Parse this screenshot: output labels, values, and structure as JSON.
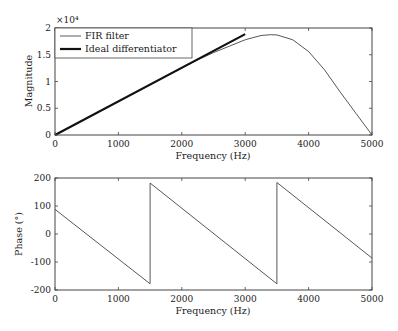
{
  "chart_data": [
    {
      "type": "line",
      "title": "",
      "xlabel": "Frequency (Hz)",
      "ylabel": "Magnitude",
      "y_multiplier_label": "×10⁴",
      "xlim": [
        0,
        5000
      ],
      "ylim": [
        0,
        2
      ],
      "xticks": [
        0,
        1000,
        2000,
        3000,
        4000,
        5000
      ],
      "xtick_labels": [
        "0",
        "1000",
        "2000",
        "3000",
        "4000",
        "5000"
      ],
      "yticks": [
        0,
        0.5,
        1,
        1.5,
        2
      ],
      "ytick_labels": [
        "0",
        "0.5",
        "1",
        "1.5",
        "2"
      ],
      "grid": false,
      "legend_position": "top-left",
      "series": [
        {
          "name": "FIR filter",
          "style": "thin",
          "x": [
            0,
            250,
            500,
            750,
            1000,
            1250,
            1500,
            1750,
            2000,
            2250,
            2500,
            2750,
            3000,
            3250,
            3400,
            3500,
            3750,
            4000,
            4250,
            4500,
            4750,
            5000
          ],
          "y": [
            0,
            0.157,
            0.314,
            0.471,
            0.628,
            0.785,
            0.942,
            1.099,
            1.255,
            1.405,
            1.54,
            1.66,
            1.78,
            1.86,
            1.875,
            1.87,
            1.78,
            1.56,
            1.22,
            0.8,
            0.4,
            0
          ]
        },
        {
          "name": "Ideal differentiator",
          "style": "thick",
          "x": [
            0,
            3000
          ],
          "y": [
            0,
            1.885
          ]
        }
      ]
    },
    {
      "type": "line",
      "title": "",
      "xlabel": "Frequency (Hz)",
      "ylabel": "Phase (°)",
      "xlim": [
        0,
        5000
      ],
      "ylim": [
        -200,
        200
      ],
      "xticks": [
        0,
        1000,
        2000,
        3000,
        4000,
        5000
      ],
      "xtick_labels": [
        "0",
        "1000",
        "2000",
        "3000",
        "4000",
        "5000"
      ],
      "yticks": [
        -200,
        -100,
        0,
        100,
        200
      ],
      "ytick_labels": [
        "-200",
        "-100",
        "0",
        "100",
        "200"
      ],
      "grid": false,
      "series": [
        {
          "name": "Phase",
          "x": [
            0,
            1500,
            1500,
            3500,
            3500,
            5000
          ],
          "y": [
            88,
            -178,
            182,
            -178,
            184,
            -86
          ]
        }
      ]
    }
  ]
}
